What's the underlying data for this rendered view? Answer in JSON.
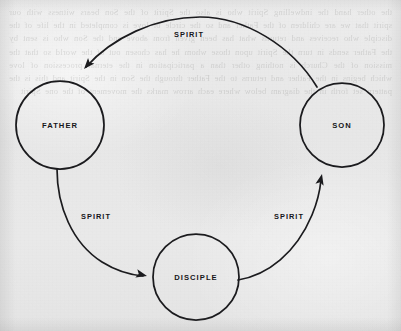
{
  "page": {
    "kind": "scanned-book-diagram",
    "background_color": "#e9e9e9",
    "ink_color": "#1b1b1e",
    "width": 401,
    "height": 331,
    "bleed_through_text": "the other hand the indwelling Spirit who is also the Spirit of the Son bears witness with our spirit that we are children of the Father and so the circle of love is completed in the life of the disciple who receives and returns what has been given from above and the Son who is sent by the Father sends in turn the Spirit upon those whom he has chosen out of the world so that the mission of the Church is nothing other than a participation in the eternal procession of love which begins in the Father and returns to the Father through the Son in the Spirit and this is the pattern set forth in the diagram below where each arrow marks the movement of the one Spirit"
  },
  "diagram": {
    "title": "",
    "type": "cycle-diagram",
    "nodes": [
      {
        "id": "father",
        "label": "FATHER",
        "cx": 60,
        "cy": 125,
        "r": 44
      },
      {
        "id": "son",
        "label": "SON",
        "cx": 342,
        "cy": 125,
        "r": 42
      },
      {
        "id": "disciple",
        "label": "DISCIPLE",
        "cx": 196,
        "cy": 277,
        "r": 43
      }
    ],
    "edges": [
      {
        "id": "son-to-father",
        "label": "SPIRIT",
        "from": "son",
        "to": "father",
        "label_x": 189,
        "label_y": 37,
        "path": "M 317 87 C 292 46 245 17 200 17 C 155 17 112 38 86 67",
        "arrow_x": 84,
        "arrow_y": 69,
        "arrow_angle": 131
      },
      {
        "id": "father-to-disciple",
        "label": "SPIRIT",
        "from": "father",
        "to": "disciple",
        "label_x": 96,
        "label_y": 219,
        "path": "M 57 169 C 57 206 72 243 102 262 C 118 272 132 275 143 276",
        "arrow_x": 147,
        "arrow_y": 276,
        "arrow_angle": 14
      },
      {
        "id": "disciple-to-son",
        "label": "SPIRIT",
        "from": "disciple",
        "to": "son",
        "label_x": 289,
        "label_y": 219,
        "path": "M 238 280 C 268 275 296 253 312 215 C 317 203 320 190 321 180",
        "arrow_x": 322,
        "arrow_y": 174,
        "arrow_angle": -77
      }
    ]
  }
}
